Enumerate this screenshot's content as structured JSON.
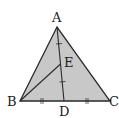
{
  "diagram": {
    "type": "geometry-triangle",
    "colors": {
      "fill": "#c8c8c8",
      "stroke": "#2a2a2a",
      "background": "#ffffff"
    },
    "points": {
      "A": {
        "label": "A",
        "x": 57,
        "y": 27
      },
      "B": {
        "label": "B",
        "x": 20,
        "y": 101
      },
      "C": {
        "label": "C",
        "x": 110,
        "y": 101
      },
      "D": {
        "label": "D",
        "x": 64,
        "y": 101
      },
      "E": {
        "label": "E",
        "x": 60,
        "y": 64
      }
    },
    "segments": [
      "AB",
      "BC",
      "CA",
      "AD",
      "BE"
    ],
    "equal_marks": [
      {
        "segments": [
          "AE",
          "ED"
        ],
        "marks": 1
      },
      {
        "segments": [
          "BD",
          "DC"
        ],
        "marks": 2
      }
    ]
  }
}
